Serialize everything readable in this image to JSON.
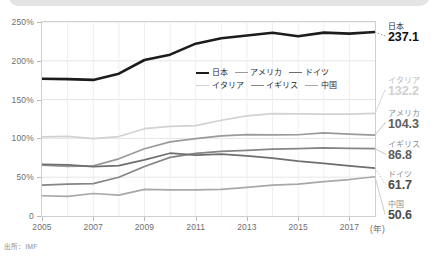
{
  "source_note": "出所：IMF",
  "axes": {
    "y_ticks": [
      "250%",
      "200%",
      "150%",
      "100%",
      "50%",
      "0"
    ],
    "x_ticks": [
      "2005",
      "2007",
      "2009",
      "2011",
      "2013",
      "2015",
      "2017"
    ],
    "x_unit": "(年)"
  },
  "legend": {
    "items": [
      {
        "label": "日本",
        "color": "#1c1c1c",
        "width": 2.6
      },
      {
        "label": "アメリカ",
        "color": "#9a9a9a",
        "width": 1.7
      },
      {
        "label": "ドイツ",
        "color": "#6e6e6e",
        "width": 1.7
      },
      {
        "label": "イタリア",
        "color": "#d2d2d2",
        "width": 1.7
      },
      {
        "label": "イギリス",
        "color": "#858585",
        "width": 1.7
      },
      {
        "label": "中国",
        "color": "#a8a8a8",
        "width": 1.7
      }
    ]
  },
  "end_labels": [
    {
      "name": "日本",
      "value": "237.1",
      "name_color": "#2b2b2b",
      "value_color": "#111111",
      "top": 4,
      "leader_y": 26,
      "leader_style": "dotted",
      "leader_color": "#9a9a9a"
    },
    {
      "name": "イタリア",
      "value": "132.2",
      "name_color": "#bdbdbd",
      "value_color": "#d0d0d0",
      "top": 58,
      "leader_y": 87,
      "leader_style": "solid",
      "leader_color": "#d8d8d8"
    },
    {
      "name": "アメリカ",
      "value": "104.3",
      "name_color": "#8f8f8f",
      "value_color": "#5e5e5e",
      "top": 91,
      "leader_y": 113,
      "leader_style": "solid",
      "leader_color": "#c4c4c4"
    },
    {
      "name": "イギリス",
      "value": "86.8",
      "name_color": "#8f8f8f",
      "value_color": "#5e5e5e",
      "top": 122,
      "leader_y": 134,
      "leader_style": "solid",
      "leader_color": "#c4c4c4"
    },
    {
      "name": "ドイツ",
      "value": "61.7",
      "name_color": "#8f8f8f",
      "value_color": "#4a4a4a",
      "top": 152,
      "leader_y": 168,
      "leader_style": "dotted",
      "leader_color": "#bdbdbd"
    },
    {
      "name": "中国",
      "value": "50.6",
      "name_color": "#8f8f8f",
      "value_color": "#4a4a4a",
      "top": 182,
      "leader_y": 182,
      "leader_style": "solid",
      "leader_color": "#cccccc"
    }
  ],
  "chart_data": {
    "type": "line",
    "title": "",
    "xlabel": "(年)",
    "ylabel": "",
    "ylim": [
      0,
      250
    ],
    "xlim": [
      2005,
      2018
    ],
    "grid": "vertical-and-horizontal-light",
    "legend_position": "inside-upper-center",
    "x": [
      2005,
      2006,
      2007,
      2008,
      2009,
      2010,
      2011,
      2012,
      2013,
      2014,
      2015,
      2016,
      2017,
      2018
    ],
    "series": [
      {
        "name": "日本",
        "color": "#1c1c1c",
        "width": 2.6,
        "values": [
          176.8,
          176.4,
          175.4,
          183.4,
          201.0,
          207.9,
          222.1,
          229.0,
          232.5,
          236.1,
          231.6,
          236.3,
          235.0,
          237.1
        ]
      },
      {
        "name": "イタリア",
        "color": "#d2d2d2",
        "width": 1.7,
        "values": [
          101.9,
          102.6,
          99.8,
          102.4,
          112.5,
          115.4,
          116.5,
          123.4,
          129.0,
          131.8,
          131.6,
          131.4,
          131.4,
          132.2
        ]
      },
      {
        "name": "アメリカ",
        "color": "#9a9a9a",
        "width": 1.7,
        "values": [
          65.4,
          64.0,
          64.6,
          73.7,
          86.6,
          95.5,
          99.8,
          103.3,
          104.9,
          104.6,
          104.7,
          107.1,
          105.5,
          104.3
        ]
      },
      {
        "name": "イギリス",
        "color": "#858585",
        "width": 1.7,
        "values": [
          39.9,
          41.0,
          41.7,
          49.9,
          63.8,
          75.6,
          80.8,
          83.2,
          84.5,
          86.2,
          86.9,
          87.9,
          87.1,
          86.8
        ]
      },
      {
        "name": "ドイツ",
        "color": "#6e6e6e",
        "width": 1.7,
        "values": [
          66.4,
          65.9,
          63.5,
          64.9,
          72.4,
          80.9,
          78.5,
          79.7,
          77.4,
          74.5,
          70.8,
          67.9,
          64.5,
          61.7
        ]
      },
      {
        "name": "中国",
        "color": "#a8a8a8",
        "width": 1.7,
        "values": [
          26.1,
          25.4,
          29.0,
          27.0,
          34.3,
          33.7,
          33.6,
          34.3,
          37.0,
          39.9,
          41.1,
          44.3,
          47.0,
          50.6
        ]
      }
    ]
  }
}
